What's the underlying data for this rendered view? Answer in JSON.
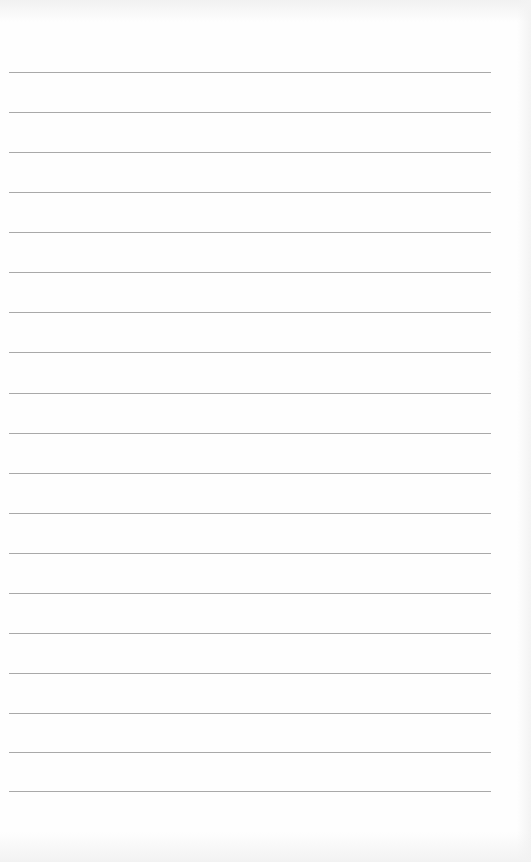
{
  "page": {
    "type": "lined-paper",
    "line_count": 19,
    "line_color": "#9a9a9a",
    "background_color": "#fefefe",
    "rules": [
      {
        "y": 72
      },
      {
        "y": 112
      },
      {
        "y": 152
      },
      {
        "y": 192
      },
      {
        "y": 232
      },
      {
        "y": 272
      },
      {
        "y": 312
      },
      {
        "y": 352
      },
      {
        "y": 393
      },
      {
        "y": 433
      },
      {
        "y": 473
      },
      {
        "y": 513
      },
      {
        "y": 553
      },
      {
        "y": 593
      },
      {
        "y": 633
      },
      {
        "y": 673
      },
      {
        "y": 713
      },
      {
        "y": 752
      },
      {
        "y": 791
      }
    ]
  }
}
